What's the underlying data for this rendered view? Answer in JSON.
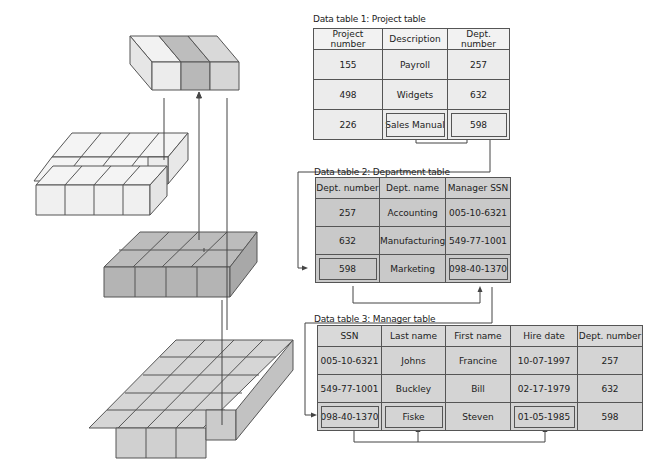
{
  "diagram": {
    "left_stack": {
      "layers": [
        {
          "name": "result-block",
          "columns": 3,
          "highlight_column": 2,
          "fill": "#ececec",
          "highlight_fill": "#bdbdbd"
        },
        {
          "name": "project-table-block",
          "fill": "#ececec"
        },
        {
          "name": "department-table-block",
          "fill": "#c9c9c9"
        },
        {
          "name": "manager-table-block",
          "fill": "#d4d4d4"
        }
      ]
    },
    "tables": [
      {
        "caption": "Data table 1: Project table",
        "headers": [
          "Project number",
          "Description",
          "Dept. number"
        ],
        "rows": [
          [
            "155",
            "Payroll",
            "257"
          ],
          [
            "498",
            "Widgets",
            "632"
          ],
          [
            "226",
            "Sales Manual",
            "598"
          ]
        ],
        "boxed_cells": [
          [
            2,
            1
          ],
          [
            2,
            2
          ]
        ]
      },
      {
        "caption": "Data table 2: Department table",
        "headers": [
          "Dept. number",
          "Dept. name",
          "Manager SSN"
        ],
        "rows": [
          [
            "257",
            "Accounting",
            "005-10-6321"
          ],
          [
            "632",
            "Manufacturing",
            "549-77-1001"
          ],
          [
            "598",
            "Marketing",
            "098-40-1370"
          ]
        ],
        "boxed_cells": [
          [
            2,
            0
          ],
          [
            2,
            2
          ]
        ]
      },
      {
        "caption": "Data table 3: Manager table",
        "headers": [
          "SSN",
          "Last name",
          "First name",
          "Hire date",
          "Dept. number"
        ],
        "rows": [
          [
            "005-10-6321",
            "Johns",
            "Francine",
            "10-07-1997",
            "257"
          ],
          [
            "549-77-1001",
            "Buckley",
            "Bill",
            "02-17-1979",
            "632"
          ],
          [
            "098-40-1370",
            "Fiske",
            "Steven",
            "01-05-1985",
            "598"
          ]
        ],
        "boxed_cells": [
          [
            2,
            0
          ],
          [
            2,
            1
          ],
          [
            2,
            3
          ]
        ]
      }
    ],
    "colors": {
      "line": "#444444",
      "table1_fill": "#ececec",
      "table2_fill": "#c9c9c9",
      "table3_fill": "#d4d4d4"
    }
  }
}
